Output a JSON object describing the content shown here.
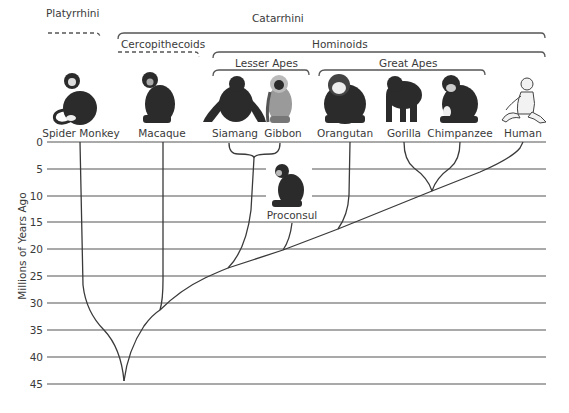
{
  "figure": {
    "y_axis": {
      "label": "Millions of Years Ago",
      "ticks": [
        "0",
        "5",
        "10",
        "15",
        "20",
        "25",
        "30",
        "35",
        "40",
        "45"
      ],
      "range": [
        0,
        45
      ]
    },
    "groups": [
      {
        "id": "platyrrhini",
        "label": "Platyrrhini",
        "style": "dashed"
      },
      {
        "id": "catarrhini",
        "label": "Catarrhini",
        "style": "solid"
      },
      {
        "id": "cercopithecoids",
        "label": "Cercopithecoids",
        "style": "dashed"
      },
      {
        "id": "hominoids",
        "label": "Hominoids",
        "style": "solid"
      },
      {
        "id": "lesser_apes",
        "label": "Lesser Apes",
        "style": "solid"
      },
      {
        "id": "great_apes",
        "label": "Great Apes",
        "style": "solid"
      }
    ],
    "taxa": [
      {
        "id": "spider_monkey",
        "label": "Spider Monkey",
        "icon": "spider-monkey-icon"
      },
      {
        "id": "macaque",
        "label": "Macaque",
        "icon": "macaque-icon"
      },
      {
        "id": "siamang",
        "label": "Siamang",
        "icon": "siamang-icon"
      },
      {
        "id": "gibbon",
        "label": "Gibbon",
        "icon": "gibbon-icon"
      },
      {
        "id": "orangutan",
        "label": "Orangutan",
        "icon": "orangutan-icon"
      },
      {
        "id": "gorilla",
        "label": "Gorilla",
        "icon": "gorilla-icon"
      },
      {
        "id": "chimpanzee",
        "label": "Chimpanzee",
        "icon": "chimpanzee-icon"
      },
      {
        "id": "human",
        "label": "Human",
        "icon": "human-icon"
      }
    ],
    "fossil": {
      "id": "proconsul",
      "label": "Proconsul",
      "icon": "proconsul-icon"
    },
    "divergences_mya": {
      "platyrrhini_catarrhini": 44,
      "cercopithecoids_hominoids": 31,
      "lesser_great_apes": 23,
      "proconsul": 20,
      "orangutan": 16,
      "gorilla_chimp_human": 9,
      "gorilla_chimp": 9,
      "siamang_gibbon": 3
    }
  }
}
